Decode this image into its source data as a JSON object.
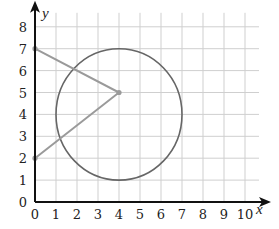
{
  "chart_data": {
    "type": "line",
    "title": "",
    "xlabel": "x",
    "ylabel": "y",
    "xlim": [
      0,
      10
    ],
    "ylim": [
      0,
      8
    ],
    "grid": true,
    "x_ticks": [
      "0",
      "1",
      "2",
      "3",
      "4",
      "5",
      "6",
      "7",
      "8",
      "9",
      "10"
    ],
    "y_ticks": [
      "0",
      "1",
      "2",
      "3",
      "4",
      "5",
      "6",
      "7",
      "8"
    ],
    "series": [
      {
        "name": "segments",
        "kind": "polyline",
        "points": [
          [
            0,
            7
          ],
          [
            4,
            5
          ],
          [
            0,
            2
          ]
        ],
        "color": "#9a9a9a"
      }
    ],
    "circles": [
      {
        "name": "circle",
        "center": [
          4,
          4
        ],
        "radius": 3,
        "color": "#666666"
      }
    ],
    "marked_points": [
      [
        0,
        7
      ],
      [
        4,
        5
      ],
      [
        0,
        2
      ]
    ]
  },
  "colors": {
    "axis": "#111111",
    "grid": "#cfcfcf",
    "segment": "#9a9a9a",
    "circle": "#666666",
    "point": "#9a9a9a"
  }
}
